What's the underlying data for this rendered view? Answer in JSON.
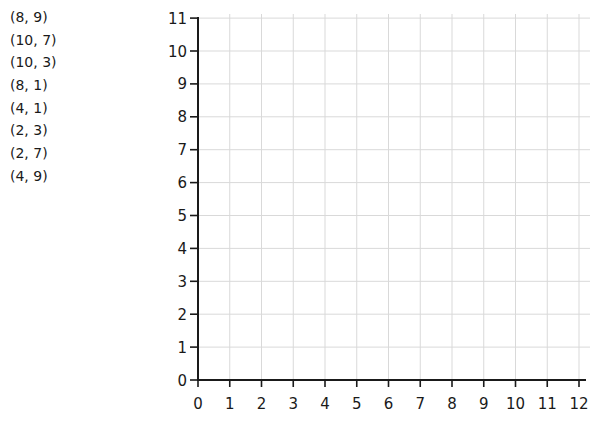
{
  "coordinates_list": [
    "(8, 9)",
    "(10, 7)",
    "(10, 3)",
    "(8, 1)",
    "(4, 1)",
    "(2, 3)",
    "(2, 7)",
    "(4, 9)"
  ],
  "grid": {
    "x_min": 0,
    "x_max": 12,
    "y_min": 0,
    "y_max": 11,
    "x_ticks": [
      "0",
      "1",
      "2",
      "3",
      "4",
      "5",
      "6",
      "7",
      "8",
      "9",
      "10",
      "11",
      "12"
    ],
    "y_ticks": [
      "0",
      "1",
      "2",
      "3",
      "4",
      "5",
      "6",
      "7",
      "8",
      "9",
      "10",
      "11"
    ],
    "grid_color": "#d9d9d9",
    "axis_color": "#1a1a1a"
  },
  "chart_data": {
    "type": "scatter",
    "title": "",
    "xlabel": "",
    "ylabel": "",
    "xlim": [
      0,
      12
    ],
    "ylim": [
      0,
      11
    ],
    "grid": true,
    "points_listed": [
      [
        8,
        9
      ],
      [
        10,
        7
      ],
      [
        10,
        3
      ],
      [
        8,
        1
      ],
      [
        4,
        1
      ],
      [
        2,
        3
      ],
      [
        2,
        7
      ],
      [
        4,
        9
      ]
    ],
    "points_plotted": [],
    "x_tick_labels": [
      "0",
      "1",
      "2",
      "3",
      "4",
      "5",
      "6",
      "7",
      "8",
      "9",
      "10",
      "11",
      "12"
    ],
    "y_tick_labels": [
      "0",
      "1",
      "2",
      "3",
      "4",
      "5",
      "6",
      "7",
      "8",
      "9",
      "10",
      "11"
    ]
  }
}
